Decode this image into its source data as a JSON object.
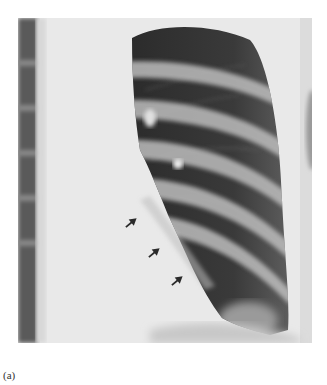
{
  "figure": {
    "type": "chest-radiograph",
    "arrows": [
      {
        "x": 132,
        "y": 222,
        "direction": "up-right"
      },
      {
        "x": 155,
        "y": 252,
        "direction": "up-right"
      },
      {
        "x": 178,
        "y": 280,
        "direction": "up-right"
      }
    ],
    "arrow_color": "#2a2a2a"
  },
  "caption": {
    "label": "(a)"
  }
}
